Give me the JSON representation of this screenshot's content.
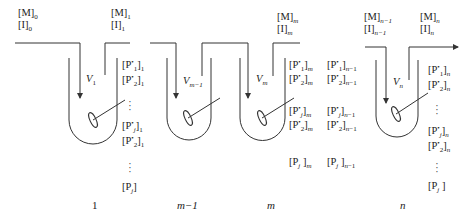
{
  "diagram": {
    "line_color": "#333333",
    "feed_labels": [
      {
        "id": "feed-0",
        "m": "[M]",
        "m_sub": "0",
        "i": "[I]",
        "i_sub": "0"
      },
      {
        "id": "feed-1",
        "m": "[M]",
        "m_sub": "1",
        "i": "[I]",
        "i_sub": "1"
      },
      {
        "id": "feed-m",
        "m": "[M]",
        "m_sub": "m",
        "i": "[I]",
        "i_sub": "m"
      },
      {
        "id": "feed-n-1",
        "m": "[M]",
        "m_sub": "n−1",
        "i": "[I]",
        "i_sub": "n−1"
      },
      {
        "id": "feed-n",
        "m": "[M]",
        "m_sub": "n",
        "i": "[I]",
        "i_sub": "n"
      }
    ],
    "volumes": [
      {
        "label": "V",
        "sub": "1"
      },
      {
        "label": "V",
        "sub": "m−1"
      },
      {
        "label": "V",
        "sub": "m"
      },
      {
        "label": "V",
        "sub": "n"
      }
    ],
    "species": {
      "p_star_1": "[P*",
      "p_j": "[P",
      "close": "]"
    },
    "columns": [
      {
        "id": "col-1",
        "sub": "1",
        "rows": [
          "[P*₁]",
          "[P*₂]",
          "⋮",
          "[P*ⱼ]",
          "[P*₂]",
          "⋮",
          "[Pⱼ]"
        ]
      },
      {
        "id": "col-m",
        "sub": "m",
        "rows": [
          "[P*₁]",
          "[P*₂]",
          "[P*ⱼ]",
          "[P*₂]",
          "[Pⱼ]"
        ]
      },
      {
        "id": "col-n-1",
        "sub": "n−1",
        "rows": [
          "[P*₁]",
          "[P*₂]",
          "[P*ⱼ]",
          "[P*₂]",
          "[Pⱼ]"
        ]
      },
      {
        "id": "col-n",
        "sub": "n",
        "rows": [
          "[P*₁]",
          "[P*₂]",
          "⋮",
          "[P*ⱼ]",
          "[P*₂]",
          "⋮",
          "[Pⱼ]"
        ]
      }
    ],
    "stage_numbers": [
      "1",
      "m−1",
      "m",
      "n"
    ]
  }
}
